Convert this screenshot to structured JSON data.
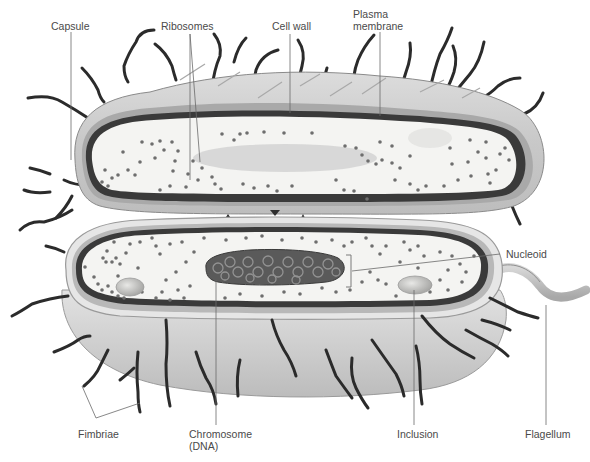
{
  "diagram": {
    "colors": {
      "background": "#ffffff",
      "cytoplasm": "#f4f4f2",
      "capsule": "#c9c9c9",
      "cell_wall": "#9a9a9a",
      "plasma_membrane": "#3a3a3a",
      "ribosome": "#6e6e6e",
      "fimbriae": "#2b2b2b",
      "chromosome": "#5a5a5a",
      "leader_line": "#6a6a6a",
      "label_text": "#4a4a4a"
    },
    "labels": {
      "capsule": "Capsule",
      "ribosomes": "Ribosomes",
      "cell_wall": "Cell wall",
      "plasma_membrane_line1": "Plasma",
      "plasma_membrane_line2": "membrane",
      "nucleoid": "Nucleoid",
      "fimbriae": "Fimbriae",
      "chromosome_line1": "Chromosome",
      "chromosome_line2": "(DNA)",
      "inclusion": "Inclusion",
      "flagellum": "Flagellum"
    }
  }
}
